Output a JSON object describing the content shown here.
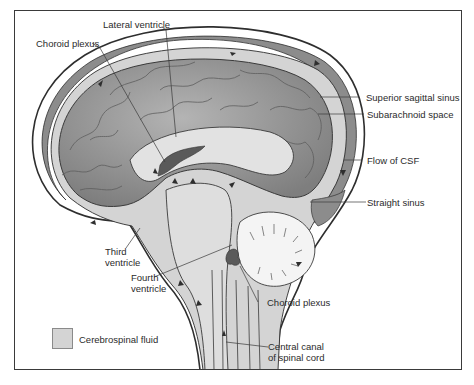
{
  "diagram": {
    "labels": {
      "lateral_ventricle": "Lateral ventricle",
      "choroid_plexus_top": "Choroid plexus",
      "superior_sagittal_sinus": "Superior sagittal sinus",
      "subarachnoid_space": "Subarachnoid space",
      "flow_of_csf": "Flow of CSF",
      "straight_sinus": "Straight sinus",
      "third_ventricle_1": "Third",
      "third_ventricle_2": "ventricle",
      "fourth_ventricle_1": "Fourth",
      "fourth_ventricle_2": "ventricle",
      "choroid_plexus_bottom": "Choroid plexus",
      "central_canal_1": "Central canal",
      "central_canal_2": "of spinal cord"
    },
    "legend": {
      "items": [
        {
          "label": "Cerebrospinal fluid",
          "color": "#d4d4d4"
        }
      ]
    },
    "colors": {
      "csf": "#d4d4d4",
      "brain": "#9a9a9a",
      "sinus": "#8c8c8c",
      "choroid_plexus": "#5a5a5a",
      "outline": "#2e2e2e",
      "frame": "#3a3a3a"
    }
  }
}
